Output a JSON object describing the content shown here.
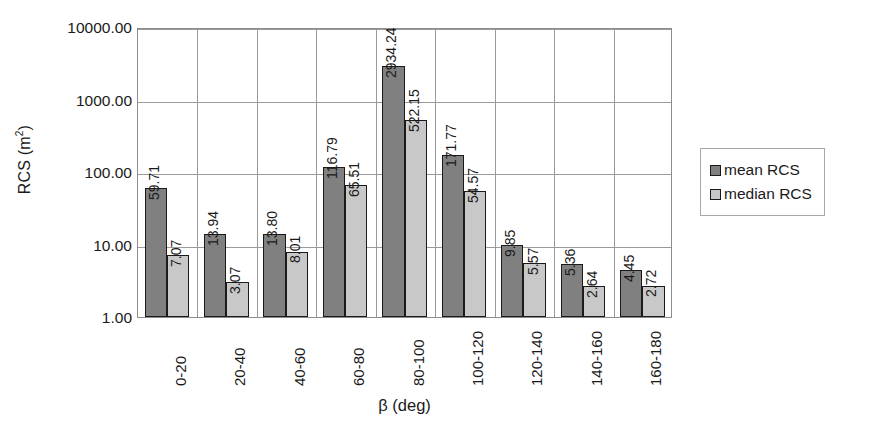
{
  "chart_data": {
    "type": "bar",
    "title": "",
    "subtitle": "",
    "xlabel": "β (deg)",
    "ylabel": "RCS (m²)",
    "ylabel_base": "RCS (m",
    "ylabel_sup": "2",
    "ylabel_tail": ")",
    "yscale": "log",
    "ylim": [
      1.0,
      10000.0
    ],
    "ytick_labels": [
      "1.00",
      "10.00",
      "100.00",
      "1000.00",
      "10000.00"
    ],
    "ytick_values": [
      1.0,
      10.0,
      100.0,
      1000.0,
      10000.0
    ],
    "grid": "both",
    "legend_position": "right-outside",
    "categories": [
      "0-20",
      "20-40",
      "40-60",
      "60-80",
      "80-100",
      "100-120",
      "120-140",
      "140-160",
      "160-180"
    ],
    "series": [
      {
        "name": "mean RCS",
        "color": "#808080",
        "values": [
          59.71,
          13.94,
          13.8,
          116.79,
          2934.24,
          171.77,
          9.85,
          5.36,
          4.45
        ],
        "labels": [
          "59.71",
          "13.94",
          "13.80",
          "116.79",
          "2934.24",
          "171.77",
          "9.85",
          "5.36",
          "4.45"
        ]
      },
      {
        "name": "median RCS",
        "color": "#c8c8c8",
        "values": [
          7.07,
          3.07,
          8.01,
          65.51,
          522.15,
          54.57,
          5.57,
          2.64,
          2.72
        ],
        "labels": [
          "7.07",
          "3.07",
          "8.01",
          "65.51",
          "522.15",
          "54.57",
          "5.57",
          "2.64",
          "2.72"
        ]
      }
    ]
  },
  "legend": {
    "items": [
      {
        "label": "mean RCS",
        "swatch": "mean"
      },
      {
        "label": "median RCS",
        "swatch": "median"
      }
    ]
  }
}
